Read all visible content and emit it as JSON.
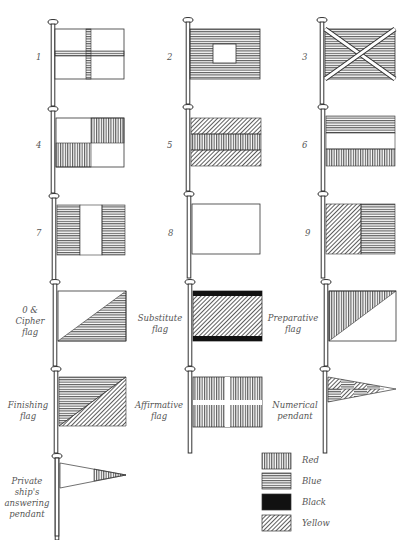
{
  "flags": [
    {
      "id": "1",
      "label": "1",
      "design": "white with blue cross"
    },
    {
      "id": "2",
      "label": "2",
      "design": "blue with white square center"
    },
    {
      "id": "3",
      "label": "3",
      "design": "blue with white saltire"
    },
    {
      "id": "4",
      "label": "4",
      "design": "quartered white and red"
    },
    {
      "id": "5",
      "label": "5",
      "design": "yellow, red, yellow horizontal"
    },
    {
      "id": "6",
      "label": "6",
      "design": "blue, white, red horizontal"
    },
    {
      "id": "7",
      "label": "7",
      "design": "blue, white, blue vertical"
    },
    {
      "id": "8",
      "label": "8",
      "design": "plain white"
    },
    {
      "id": "9",
      "label": "9",
      "design": "yellow hoist, blue fly"
    },
    {
      "id": "0",
      "label": "0 & Cipher flag",
      "design": "white/blue diagonal"
    },
    {
      "id": "substitute",
      "label": "Substitute flag",
      "design": "yellow with black borders"
    },
    {
      "id": "preparative",
      "label": "Preparative flag",
      "design": "red/white diagonal"
    },
    {
      "id": "finishing",
      "label": "Finishing flag",
      "design": "blue/yellow diagonal"
    },
    {
      "id": "affirmative",
      "label": "Affirmative flag",
      "design": "red with white cross"
    },
    {
      "id": "numerical",
      "label": "Numerical pendant",
      "design": "chequered blue and yellow pendant"
    },
    {
      "id": "answering",
      "label": "Private ship's answering pendant",
      "design": "white pendant with red tip"
    }
  ],
  "labels": {
    "f1": "1",
    "f2": "2",
    "f3": "3",
    "f4": "4",
    "f5": "5",
    "f6": "6",
    "f7": "7",
    "f8": "8",
    "f9": "9",
    "cipher_1": "0 &",
    "cipher_2": "Cipher",
    "cipher_3": "flag",
    "substitute_1": "Substitute",
    "substitute_2": "flag",
    "preparative_1": "Preparative",
    "preparative_2": "flag",
    "finishing_1": "Finishing",
    "finishing_2": "flag",
    "affirmative_1": "Affirmative",
    "affirmative_2": "flag",
    "numerical_1": "Numerical",
    "numerical_2": "pendant",
    "answering_1": "Private",
    "answering_2": "ship's",
    "answering_3": "answering",
    "answering_4": "pendant"
  },
  "legend": [
    {
      "pattern": "vertical lines",
      "label": "Red"
    },
    {
      "pattern": "horizontal lines",
      "label": "Blue"
    },
    {
      "pattern": "solid",
      "label": "Black"
    },
    {
      "pattern": "diagonal lines",
      "label": "Yellow"
    }
  ],
  "colors": {
    "ink": "#333333",
    "paper": "#ffffff",
    "label": "#555555"
  }
}
